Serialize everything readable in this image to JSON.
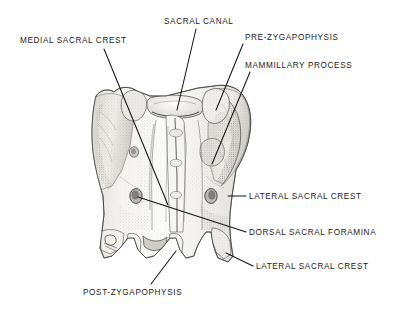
{
  "figure": {
    "view": "dorsal",
    "style": "grayscale stipple and line anatomical illustration",
    "background_color": "#ffffff",
    "ink_color": "#1a1a1a",
    "width": 410,
    "height": 314
  },
  "labels": {
    "medial_sacral_crest": "MEDIAL SACRAL CREST",
    "sacral_canal": "SACRAL CANAL",
    "pre_zygapophysis": "PRE-ZYGAPOPHYSIS",
    "mammillary_process": "MAMMILLARY PROCESS",
    "lateral_sacral_crest_upper": "LATERAL SACRAL CREST",
    "dorsal_sacral_foramina": "DORSAL SACRAL FORAMINA",
    "lateral_sacral_crest_lower": "LATERAL SACRAL CREST",
    "post_zygapophysis": "POST-ZYGAPOPHYSIS"
  },
  "leader_lines": [
    {
      "name": "medial-sacral-crest-leader",
      "from": [
        104,
        49
      ],
      "to": [
        168,
        205
      ]
    },
    {
      "name": "sacral-canal-leader",
      "from": [
        196,
        29
      ],
      "to": [
        177,
        109
      ]
    },
    {
      "name": "pre-zygapophysis-leader",
      "from": [
        243,
        44
      ],
      "to": [
        217,
        110
      ]
    },
    {
      "name": "mammillary-process-leader",
      "from": [
        250,
        72
      ],
      "to": [
        213,
        163
      ]
    },
    {
      "name": "lateral-sacral-crest-upper-leader",
      "from": [
        246,
        196
      ],
      "to": [
        228,
        196
      ]
    },
    {
      "name": "dorsal-sacral-foramina-leader",
      "from": [
        246,
        232
      ],
      "to": [
        137,
        196
      ]
    },
    {
      "name": "lateral-sacral-crest-lower-leader",
      "from": [
        253,
        266
      ],
      "to": [
        226,
        253
      ]
    },
    {
      "name": "post-zygapophysis-leader",
      "from": [
        151,
        284
      ],
      "to": [
        175,
        252
      ]
    }
  ],
  "anatomy_parts": [
    "sacral canal",
    "medial sacral crest",
    "lateral sacral crest",
    "dorsal sacral foramina",
    "pre-zygapophysis",
    "post-zygapophysis",
    "mammillary process",
    "sacral ala"
  ]
}
